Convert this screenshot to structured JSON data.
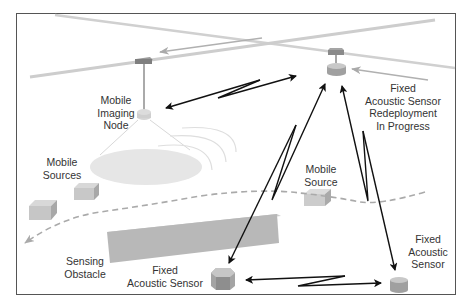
{
  "diagram": {
    "labels": {
      "mobile_imaging_node": [
        "Mobile",
        "Imaging",
        "Node"
      ],
      "mobile_sources": [
        "Mobile",
        "Sources"
      ],
      "mobile_source": [
        "Mobile",
        "Source"
      ],
      "fixed_sensor_redeploy": [
        "Fixed",
        "Acoustic Sensor",
        "Redeployment",
        "In Progress"
      ],
      "sensing_obstacle": [
        "Sensing",
        "Obstacle"
      ],
      "fixed_sensor_center": [
        "Fixed",
        "Acoustic Sensor"
      ],
      "fixed_sensor_right": [
        "Fixed",
        "Acoustic",
        "Sensor"
      ]
    },
    "colors": {
      "frame": "#555555",
      "rail": "#c8c8c8",
      "trolley": "#8a8a8a",
      "sensor_top": "#bdbdbd",
      "sensor_side": "#999999",
      "footprint": "#e6e6e6",
      "box": "#c4c4c4",
      "obstacle": "#b5b5b5",
      "dashed_path": "#aaaaaa",
      "link_arrow": "#111111"
    }
  }
}
